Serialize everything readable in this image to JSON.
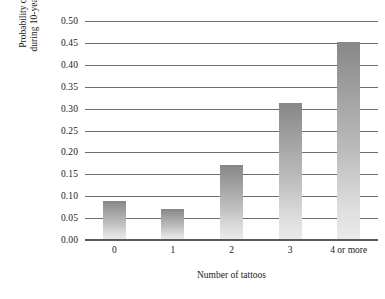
{
  "chart_data": {
    "type": "bar",
    "title": "",
    "xlabel": "Number of tattoos",
    "ylabel_line1": "Probability of death",
    "ylabel_line2": "during 10-year period",
    "categories": [
      "0",
      "1",
      "2",
      "3",
      "4 or more"
    ],
    "values": [
      0.09,
      0.07,
      0.172,
      0.312,
      0.452
    ],
    "ylim": [
      0.0,
      0.5
    ],
    "ytick_labels": [
      "0.00",
      "0.05",
      "0.10",
      "0.15",
      "0.20",
      "0.25",
      "0.30",
      "0.35",
      "0.40",
      "0.45",
      "0.50"
    ],
    "ytick_values": [
      0.0,
      0.05,
      0.1,
      0.15,
      0.2,
      0.25,
      0.3,
      0.35,
      0.4,
      0.45,
      0.5
    ],
    "grid": true,
    "legend": "none",
    "colors": {
      "bar_gradient_top": "#878787",
      "bar_gradient_bottom": "#ebebeb",
      "gridline": "#6e6e6e",
      "axis": "#5a5a5a",
      "text": "#1a1a1a",
      "background": "#ffffff"
    }
  }
}
